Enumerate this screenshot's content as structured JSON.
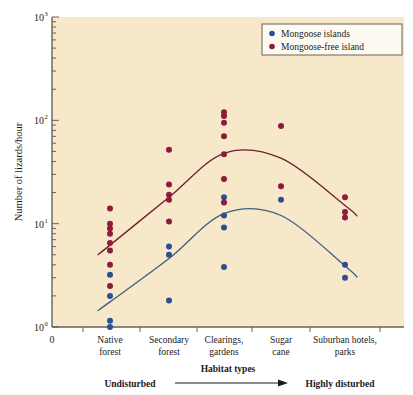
{
  "chart_data": {
    "type": "scatter",
    "title": "",
    "xlabel": "Habitat types",
    "ylabel": "Number of lizards/hour",
    "yscale": "log",
    "ylim": [
      1,
      1000
    ],
    "ytick_labels": [
      "10",
      "10",
      "10",
      "10"
    ],
    "ytick_exponents": [
      "0",
      "1",
      "2",
      "3"
    ],
    "ytick_values": [
      1,
      10,
      100,
      1000
    ],
    "x_origin_label": "0",
    "grid": false,
    "legend_position": "top-right",
    "categories": [
      "Native forest",
      "Secondary forest",
      "Clearings, gardens",
      "Sugar cane",
      "Suburban hotels, parks"
    ],
    "category_lines": [
      [
        "Native",
        "forest"
      ],
      [
        "Secondary",
        "forest"
      ],
      [
        "Clearings,",
        "gardens"
      ],
      [
        "Sugar",
        "cane"
      ],
      [
        "Suburban hotels,",
        "parks"
      ]
    ],
    "axis_annotations": {
      "left": "Undisturbed",
      "right": "Highly disturbed",
      "center": "Habitat types"
    },
    "series": [
      {
        "name": "Mongoose islands",
        "color": "#2b4f97",
        "points": [
          {
            "category": "Native forest",
            "value": 3.2
          },
          {
            "category": "Native forest",
            "value": 2.0
          },
          {
            "category": "Native forest",
            "value": 1.15
          },
          {
            "category": "Native forest",
            "value": 1.0
          },
          {
            "category": "Secondary forest",
            "value": 6.0
          },
          {
            "category": "Secondary forest",
            "value": 5.0
          },
          {
            "category": "Secondary forest",
            "value": 1.8
          },
          {
            "category": "Clearings, gardens",
            "value": 18.0
          },
          {
            "category": "Clearings, gardens",
            "value": 12.0
          },
          {
            "category": "Clearings, gardens",
            "value": 9.2
          },
          {
            "category": "Clearings, gardens",
            "value": 3.8
          },
          {
            "category": "Sugar cane",
            "value": 17.0
          },
          {
            "category": "Suburban hotels, parks",
            "value": 4.0
          },
          {
            "category": "Suburban hotels, parks",
            "value": 3.0
          }
        ],
        "trend": [
          {
            "category": "Native forest",
            "value": 1.75
          },
          {
            "category": "Secondary forest",
            "value": 4.6
          },
          {
            "category": "Clearings, gardens",
            "value": 12.5
          },
          {
            "category": "Sugar cane",
            "value": 12.0
          },
          {
            "category": "Suburban hotels, parks",
            "value": 3.9
          }
        ]
      },
      {
        "name": "Mongoose-free island",
        "color": "#8e1a3c",
        "points": [
          {
            "category": "Native forest",
            "value": 14.0
          },
          {
            "category": "Native forest",
            "value": 10.0
          },
          {
            "category": "Native forest",
            "value": 9.0
          },
          {
            "category": "Native forest",
            "value": 8.0
          },
          {
            "category": "Native forest",
            "value": 6.5
          },
          {
            "category": "Native forest",
            "value": 5.5
          },
          {
            "category": "Native forest",
            "value": 4.0
          },
          {
            "category": "Native forest",
            "value": 2.5
          },
          {
            "category": "Secondary forest",
            "value": 52.0
          },
          {
            "category": "Secondary forest",
            "value": 24.0
          },
          {
            "category": "Secondary forest",
            "value": 19.0
          },
          {
            "category": "Secondary forest",
            "value": 17.0
          },
          {
            "category": "Secondary forest",
            "value": 10.5
          },
          {
            "category": "Clearings, gardens",
            "value": 120.0
          },
          {
            "category": "Clearings, gardens",
            "value": 110.0
          },
          {
            "category": "Clearings, gardens",
            "value": 95.0
          },
          {
            "category": "Clearings, gardens",
            "value": 70.0
          },
          {
            "category": "Clearings, gardens",
            "value": 47.0
          },
          {
            "category": "Clearings, gardens",
            "value": 27.0
          },
          {
            "category": "Clearings, gardens",
            "value": 16.0
          },
          {
            "category": "Sugar cane",
            "value": 88.0
          },
          {
            "category": "Sugar cane",
            "value": 23.0
          },
          {
            "category": "Suburban hotels, parks",
            "value": 18.0
          },
          {
            "category": "Suburban hotels, parks",
            "value": 13.0
          },
          {
            "category": "Suburban hotels, parks",
            "value": 11.5
          }
        ],
        "trend": [
          {
            "category": "Native forest",
            "value": 6.2
          },
          {
            "category": "Secondary forest",
            "value": 18.0
          },
          {
            "category": "Clearings, gardens",
            "value": 48.0
          },
          {
            "category": "Sugar cane",
            "value": 43.0
          },
          {
            "category": "Suburban hotels, parks",
            "value": 15.0
          }
        ]
      }
    ],
    "legend": [
      {
        "label": "Mongoose islands",
        "color": "#2b4f97"
      },
      {
        "label": "Mongoose-free island",
        "color": "#8e1a3c"
      }
    ],
    "plot_background": "#f6e8c8",
    "axis_color": "#6b6256"
  }
}
